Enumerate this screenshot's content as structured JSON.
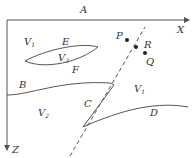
{
  "diagram": {
    "type": "geological cross-section",
    "colors": {
      "line": "#555555",
      "text": "#333333",
      "background": "#ffffff"
    },
    "axes": {
      "x_label": "X",
      "z_label": "Z",
      "surface_label": "A"
    },
    "regions": [
      {
        "label": "V",
        "subscript": "1",
        "position": "upper-left"
      },
      {
        "label": "V",
        "subscript": "3",
        "position": "lens"
      },
      {
        "label": "V",
        "subscript": "1",
        "position": "right-middle"
      },
      {
        "label": "V",
        "subscript": "2",
        "position": "lower-left"
      }
    ],
    "boundaries": [
      {
        "label": "E",
        "description": "upper lens boundary"
      },
      {
        "label": "F",
        "description": "lower lens boundary"
      },
      {
        "label": "B",
        "description": "interface left"
      },
      {
        "label": "C",
        "description": "fault segment"
      },
      {
        "label": "D",
        "description": "interface right"
      }
    ],
    "points": [
      {
        "label": "P"
      },
      {
        "label": "R"
      },
      {
        "label": "Q"
      }
    ]
  }
}
